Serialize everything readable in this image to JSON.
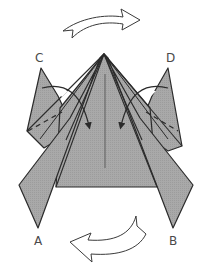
{
  "diagram": {
    "type": "origami-fold-step",
    "labels": {
      "a": "A",
      "b": "B",
      "c": "C",
      "d": "D"
    },
    "arrows": {
      "top": "rotate / turn right (hollow curved arrow)",
      "bottom": "rotate / turn left (hollow curved arrow)"
    },
    "colors": {
      "paper": "#a9a9a9",
      "outline": "#2b2b2b",
      "background": "#ffffff",
      "arrow_fill": "#ffffff",
      "label": "#4a4a4a"
    }
  }
}
